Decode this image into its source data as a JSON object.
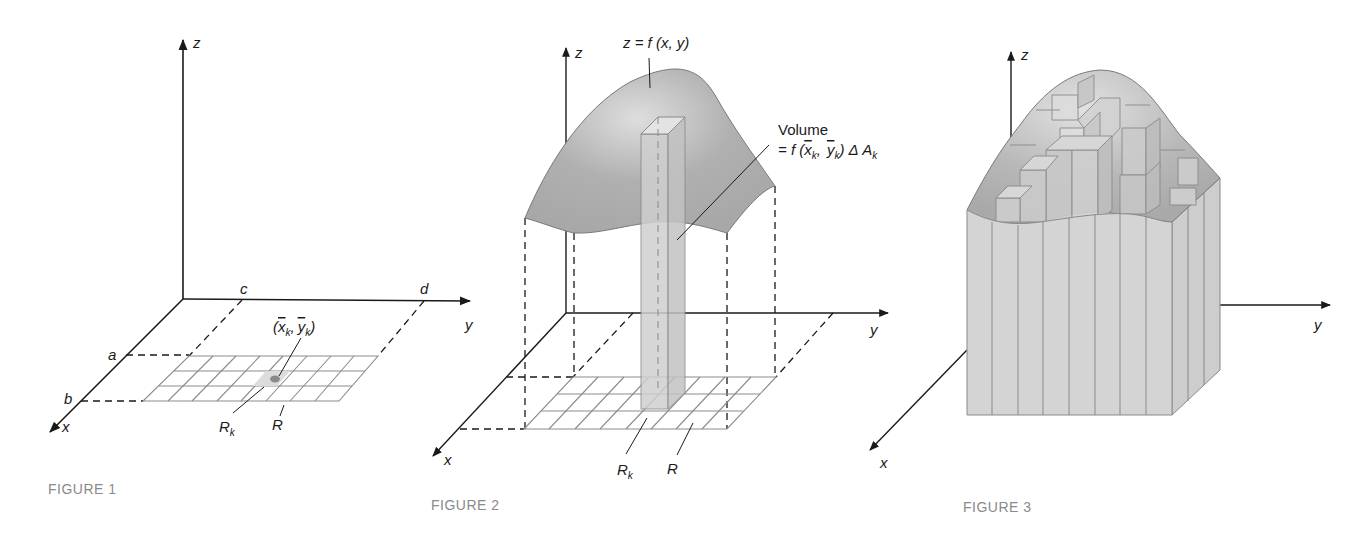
{
  "figures": [
    {
      "id": "figure-1",
      "caption": "FIGURE 1",
      "axes": {
        "x": "x",
        "y": "y",
        "z": "z"
      },
      "bounds": {
        "a": "a",
        "b": "b",
        "c": "c",
        "d": "d"
      },
      "point_label": {
        "open": "(",
        "x": "x",
        "xsub": "k",
        "comma": ",",
        "y": "y",
        "ysub": "k",
        "close": ")"
      },
      "subrect_label": {
        "main": "R",
        "sub": "k"
      },
      "region_label": "R",
      "grid": {
        "rows": 3,
        "cols": 8
      }
    },
    {
      "id": "figure-2",
      "caption": "FIGURE 2",
      "axes": {
        "x": "x",
        "y": "y",
        "z": "z"
      },
      "surface_label": "z = f (x, y)",
      "volume_label": {
        "title": "Volume",
        "eq_prefix": "= f (",
        "x": "x",
        "xsub": "k",
        "sep": ",",
        "y": "y",
        "ysub": "k",
        "eq_suffix": ") Δ A",
        "asub": "k"
      },
      "subrect_label": {
        "main": "R",
        "sub": "k"
      },
      "region_label": "R",
      "grid": {
        "rows": 3,
        "cols": 8
      }
    },
    {
      "id": "figure-3",
      "caption": "FIGURE 3",
      "axes": {
        "x": "x",
        "y": "y",
        "z": "z"
      }
    }
  ],
  "colors": {
    "ink": "#1a1a1a",
    "grid": "#8c8c8c",
    "surface": "#b3b3b3",
    "surface_light": "#d8d8d8",
    "column": "#cfcfcf",
    "caption": "#8a8a8a"
  }
}
